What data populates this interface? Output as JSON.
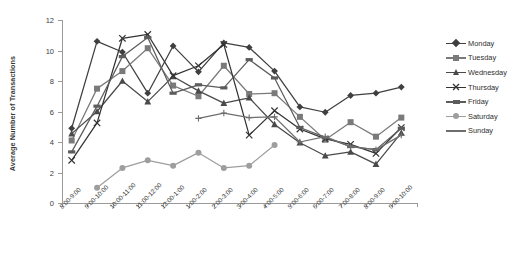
{
  "chart_data": {
    "type": "line",
    "title": "",
    "xlabel": "",
    "ylabel": "Average Number of Transactions",
    "ylim": [
      0,
      12
    ],
    "yticks": [
      0,
      2,
      4,
      6,
      8,
      10,
      12
    ],
    "grid": false,
    "legend_position": "right",
    "categories": [
      "8:00-9:00",
      "9:00-10:00",
      "10:00-11:00",
      "11:00-12:00",
      "12:00-1:00",
      "1:00-2:00",
      "2:00-3:00",
      "3:00-4:00",
      "4:00-5:00",
      "5:00-6:00",
      "6:00-7:00",
      "7:00-8:00",
      "8:00-9:00",
      "9:00-10:00"
    ],
    "series": [
      {
        "name": "Monday",
        "marker": "diamond",
        "color": "#3f3f3f",
        "values": [
          4.9,
          10.6,
          9.9,
          7.2,
          10.3,
          8.6,
          10.5,
          10.2,
          8.65,
          6.3,
          5.95,
          7.05,
          7.2,
          7.6
        ]
      },
      {
        "name": "Tuesday",
        "marker": "square",
        "color": "#7a7a7a",
        "values": [
          4.1,
          7.5,
          8.65,
          10.15,
          7.7,
          7.0,
          9.0,
          7.15,
          7.2,
          5.65,
          4.15,
          5.3,
          4.35,
          5.6
        ]
      },
      {
        "name": "Wednesday",
        "marker": "triangle",
        "color": "#4a4a4a",
        "values": [
          4.55,
          6.0,
          8.0,
          6.65,
          8.3,
          7.35,
          6.55,
          6.9,
          5.15,
          3.95,
          3.1,
          3.35,
          2.55,
          4.6
        ]
      },
      {
        "name": "Thursday",
        "marker": "cross",
        "color": "#333333",
        "values": [
          2.8,
          5.25,
          10.8,
          11.05,
          8.35,
          9.0,
          10.4,
          4.45,
          6.05,
          4.85,
          4.2,
          3.85,
          3.25,
          4.95
        ]
      },
      {
        "name": "Friday",
        "marker": "dash",
        "color": "#5c5c5c",
        "values": [
          3.35,
          6.35,
          9.6,
          10.85,
          7.2,
          7.75,
          7.55,
          9.4,
          8.2,
          4.95,
          4.3,
          3.7,
          3.5,
          4.9
        ]
      },
      {
        "name": "Saturday",
        "marker": "circle",
        "color": "#9e9e9e",
        "values": [
          null,
          1.0,
          2.3,
          2.8,
          2.45,
          3.3,
          2.3,
          2.45,
          3.8,
          null,
          null,
          null,
          null,
          null
        ]
      },
      {
        "name": "Sunday",
        "marker": "plus",
        "color": "#6e6e6e",
        "values": [
          null,
          null,
          null,
          null,
          null,
          5.55,
          5.9,
          5.6,
          5.65,
          4.0,
          4.35,
          3.7,
          3.5,
          4.45
        ]
      }
    ]
  },
  "legend": {
    "items": [
      {
        "label": "Monday"
      },
      {
        "label": "Tuesday"
      },
      {
        "label": "Wednesday"
      },
      {
        "label": "Thursday"
      },
      {
        "label": "Friday"
      },
      {
        "label": "Saturday"
      },
      {
        "label": "Sunday"
      }
    ]
  },
  "axes": {
    "y_title": "Average Number of Transactions"
  }
}
